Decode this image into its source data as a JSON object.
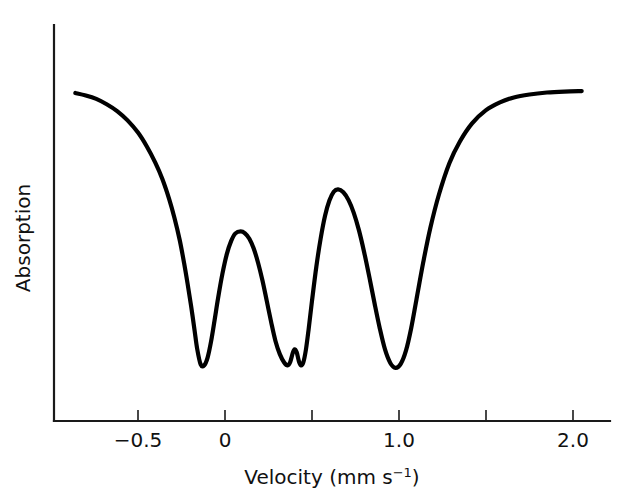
{
  "chart_data": {
    "type": "line",
    "title": "",
    "subtitle": "",
    "xlabel_text": "Velocity (mm s",
    "xlabel_sup": "−1",
    "xlabel_tail": ")",
    "xlabel_full": "Velocity (mm s−1)",
    "ylabel": "Absorption",
    "xlim": [
      -0.9,
      2.15
    ],
    "ylim": [
      0,
      1
    ],
    "grid": false,
    "legend": null,
    "annotations": [],
    "x_ticks": [
      {
        "value": -0.5,
        "label": "−0.5",
        "labeled": true
      },
      {
        "value": 0,
        "label": "0",
        "labeled": true
      },
      {
        "value": 0.5,
        "label": "",
        "labeled": false
      },
      {
        "value": 1.0,
        "label": "1.0",
        "labeled": true
      },
      {
        "value": 1.5,
        "label": "",
        "labeled": false
      },
      {
        "value": 2.0,
        "label": "2.0",
        "labeled": true
      }
    ],
    "y_ticks": [],
    "y_axis_has_scale": false,
    "series": [
      {
        "name": "absorption",
        "color": "#000000",
        "x": [
          -0.86,
          -0.8,
          -0.74,
          -0.68,
          -0.62,
          -0.56,
          -0.5,
          -0.45,
          -0.4,
          -0.36,
          -0.32,
          -0.29,
          -0.26,
          -0.235,
          -0.215,
          -0.195,
          -0.175,
          -0.16,
          -0.14,
          -0.12,
          -0.1,
          -0.08,
          -0.06,
          -0.04,
          -0.015,
          0.01,
          0.035,
          0.06,
          0.09,
          0.115,
          0.14,
          0.165,
          0.19,
          0.215,
          0.24,
          0.265,
          0.29,
          0.315,
          0.34,
          0.36,
          0.375,
          0.39,
          0.4,
          0.412,
          0.425,
          0.437,
          0.45,
          0.465,
          0.48,
          0.5,
          0.525,
          0.55,
          0.575,
          0.6,
          0.625,
          0.65,
          0.68,
          0.71,
          0.74,
          0.77,
          0.8,
          0.83,
          0.86,
          0.89,
          0.92,
          0.95,
          0.98,
          1.01,
          1.04,
          1.07,
          1.1,
          1.14,
          1.18,
          1.23,
          1.29,
          1.35,
          1.42,
          1.5,
          1.58,
          1.66,
          1.75,
          1.85,
          1.95,
          2.05
        ],
        "y": [
          0.955,
          0.95,
          0.943,
          0.932,
          0.918,
          0.899,
          0.874,
          0.846,
          0.812,
          0.779,
          0.737,
          0.699,
          0.654,
          0.607,
          0.565,
          0.52,
          0.47,
          0.432,
          0.4,
          0.398,
          0.414,
          0.447,
          0.49,
          0.535,
          0.585,
          0.625,
          0.652,
          0.668,
          0.672,
          0.668,
          0.657,
          0.637,
          0.608,
          0.572,
          0.53,
          0.487,
          0.448,
          0.421,
          0.404,
          0.398,
          0.405,
          0.424,
          0.431,
          0.425,
          0.406,
          0.398,
          0.404,
          0.43,
          0.47,
          0.53,
          0.6,
          0.658,
          0.704,
          0.735,
          0.753,
          0.758,
          0.752,
          0.736,
          0.71,
          0.674,
          0.629,
          0.578,
          0.524,
          0.473,
          0.43,
          0.403,
          0.393,
          0.401,
          0.428,
          0.474,
          0.532,
          0.61,
          0.679,
          0.748,
          0.812,
          0.856,
          0.893,
          0.92,
          0.936,
          0.946,
          0.952,
          0.956,
          0.958,
          0.959
        ]
      }
    ],
    "features": [
      {
        "kind": "absorption-minimum",
        "velocity": -0.14,
        "note": "line 1 deepest dip"
      },
      {
        "kind": "local-maximum",
        "velocity": 0.09,
        "note": "recovery peak"
      },
      {
        "kind": "absorption-minimum",
        "velocity": 0.36,
        "note": "line 2 dip"
      },
      {
        "kind": "local-maximum",
        "velocity": 0.4,
        "note": "small shoulder bump"
      },
      {
        "kind": "absorption-minimum",
        "velocity": 0.44,
        "note": "line 3 dip"
      },
      {
        "kind": "local-maximum",
        "velocity": 0.65,
        "note": "recovery peak"
      },
      {
        "kind": "absorption-minimum",
        "velocity": 1.02,
        "note": "line 4 deepest dip"
      }
    ]
  },
  "axes": {
    "origin_px": {
      "x": 54,
      "y": 421
    },
    "y_top_px": 25,
    "x_right_px": 610
  }
}
